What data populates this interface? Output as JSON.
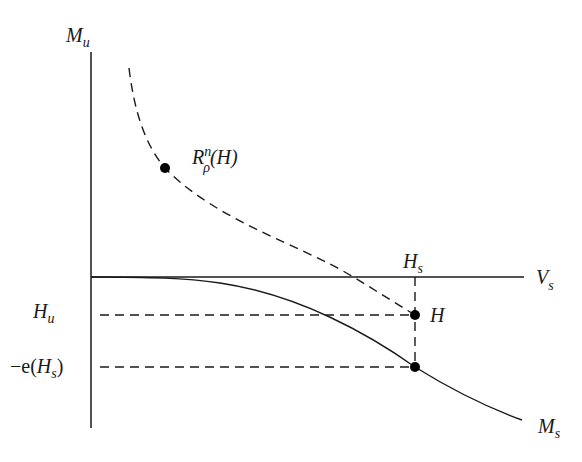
{
  "diagram": {
    "type": "phase-space diagram",
    "axes": {
      "vertical": {
        "label_main": "M",
        "label_sub": "u"
      },
      "horizontal": {
        "label_main": "V",
        "label_sub": "s"
      }
    },
    "curves": [
      {
        "id": "rescaled-curve",
        "style": "dashed",
        "description": "curve through R^n_rho(H) ending at H"
      },
      {
        "id": "stable-manifold",
        "style": "solid",
        "label_main": "M",
        "label_sub": "s"
      }
    ],
    "points": {
      "rescaled": {
        "main": "R",
        "sup": "n",
        "sub": "ρ",
        "arg": "(H)"
      },
      "H": {
        "label": "H"
      },
      "stable_point": {
        "label": ""
      }
    },
    "guides": {
      "Hs": {
        "label_main": "H",
        "label_sub": "s"
      },
      "Hu": {
        "label_main": "H",
        "label_sub": "u"
      },
      "neg_e_Hs": {
        "prefix": "−e(",
        "label_main": "H",
        "label_sub": "s",
        "suffix": ")"
      }
    }
  }
}
